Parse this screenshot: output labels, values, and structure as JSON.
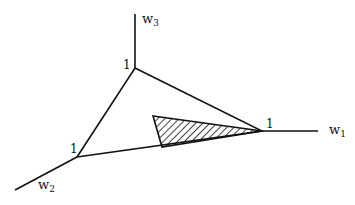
{
  "diagram": {
    "type": "simplex-in-weight-space",
    "axes": [
      {
        "name": "w1",
        "base": "w",
        "sub": "1"
      },
      {
        "name": "w2",
        "base": "w",
        "sub": "2"
      },
      {
        "name": "w3",
        "base": "w",
        "sub": "3"
      }
    ],
    "vertex_labels": {
      "w1": "1",
      "w2": "1",
      "w3": "1"
    },
    "shaded_region": "hatched triangle inside the simplex touching the w1 vertex",
    "colors": {
      "line": "#111111",
      "background": "#ffffff",
      "hatch": "#111111"
    }
  }
}
